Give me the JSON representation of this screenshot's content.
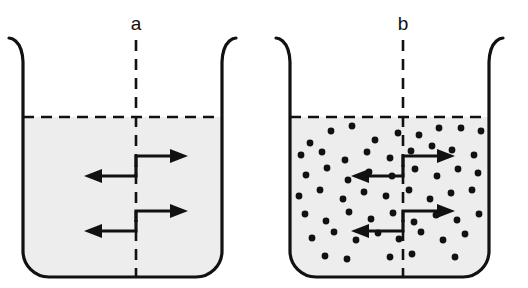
{
  "figure": {
    "width": 528,
    "height": 288,
    "background_color": "#ffffff"
  },
  "colors": {
    "outline": "#111111",
    "liquid_fill": "#ededed",
    "particle": "#111111",
    "dashed_line": "#111111",
    "arrow": "#111111",
    "label_text": "#101010"
  },
  "panels": [
    {
      "id": "panel-a",
      "label": "a",
      "label_x": 136,
      "label_y": 30,
      "description": "Beaker of pure solvent with equal exchange arrows across the dashed vertical boundary",
      "beaker": {
        "left_x": 23,
        "right_x": 222,
        "top_y": 38,
        "bottom_y": 277,
        "corner_radius": 26,
        "rim_flare": 14,
        "rim_flare_height": 24
      },
      "liquid": {
        "surface_y": 117,
        "fill": "#ededed",
        "surface_style": "dashed"
      },
      "centerline": {
        "x": 136,
        "top_y": 40,
        "bottom_y": 277,
        "style": "dashed"
      },
      "particles": [],
      "particle_count": 0,
      "arrow_pairs": [
        {
          "y_right": 156,
          "y_left": 176,
          "elbow_x": 136
        },
        {
          "y_right": 211,
          "y_left": 231,
          "elbow_x": 136
        }
      ]
    },
    {
      "id": "panel-b",
      "label": "b",
      "label_x": 403,
      "label_y": 30,
      "description": "Beaker of solution containing dispersed solute particles with equal exchange arrows across the dashed vertical boundary",
      "beaker": {
        "left_x": 290,
        "right_x": 489,
        "top_y": 38,
        "bottom_y": 277,
        "corner_radius": 26,
        "rim_flare": 14,
        "rim_flare_height": 24
      },
      "liquid": {
        "surface_y": 117,
        "fill": "#ededed",
        "surface_style": "dashed"
      },
      "centerline": {
        "x": 403,
        "top_y": 40,
        "bottom_y": 277,
        "style": "dashed"
      },
      "particle_radius": 3.4,
      "particle_count": 58,
      "particles": [
        [
          310,
          143
        ],
        [
          331,
          131
        ],
        [
          352,
          126
        ],
        [
          375,
          140
        ],
        [
          398,
          133
        ],
        [
          419,
          135
        ],
        [
          439,
          128
        ],
        [
          461,
          128
        ],
        [
          481,
          131
        ],
        [
          301,
          155
        ],
        [
          322,
          152
        ],
        [
          345,
          160
        ],
        [
          367,
          152
        ],
        [
          390,
          158
        ],
        [
          411,
          151
        ],
        [
          432,
          146
        ],
        [
          452,
          150
        ],
        [
          474,
          155
        ],
        [
          306,
          175
        ],
        [
          327,
          168
        ],
        [
          348,
          180
        ],
        [
          369,
          172
        ],
        [
          392,
          176
        ],
        [
          415,
          169
        ],
        [
          437,
          176
        ],
        [
          458,
          169
        ],
        [
          478,
          173
        ],
        [
          299,
          196
        ],
        [
          320,
          190
        ],
        [
          343,
          199
        ],
        [
          364,
          192
        ],
        [
          386,
          196
        ],
        [
          409,
          190
        ],
        [
          430,
          199
        ],
        [
          451,
          193
        ],
        [
          472,
          190
        ],
        [
          305,
          214
        ],
        [
          326,
          221
        ],
        [
          349,
          212
        ],
        [
          371,
          219
        ],
        [
          393,
          213
        ],
        [
          414,
          222
        ],
        [
          436,
          215
        ],
        [
          457,
          220
        ],
        [
          479,
          214
        ],
        [
          312,
          238
        ],
        [
          334,
          232
        ],
        [
          356,
          240
        ],
        [
          378,
          233
        ],
        [
          399,
          239
        ],
        [
          421,
          232
        ],
        [
          443,
          240
        ],
        [
          465,
          234
        ],
        [
          325,
          256
        ],
        [
          347,
          259
        ],
        [
          390,
          257
        ],
        [
          412,
          254
        ],
        [
          455,
          257
        ]
      ],
      "arrow_pairs": [
        {
          "y_right": 156,
          "y_left": 176,
          "elbow_x": 403
        },
        {
          "y_right": 211,
          "y_left": 231,
          "elbow_x": 403
        }
      ]
    }
  ],
  "arrow_geometry": {
    "shaft_length": 42,
    "stem_height": 11,
    "head_length": 12,
    "head_half_width": 6,
    "line_width": 3
  }
}
